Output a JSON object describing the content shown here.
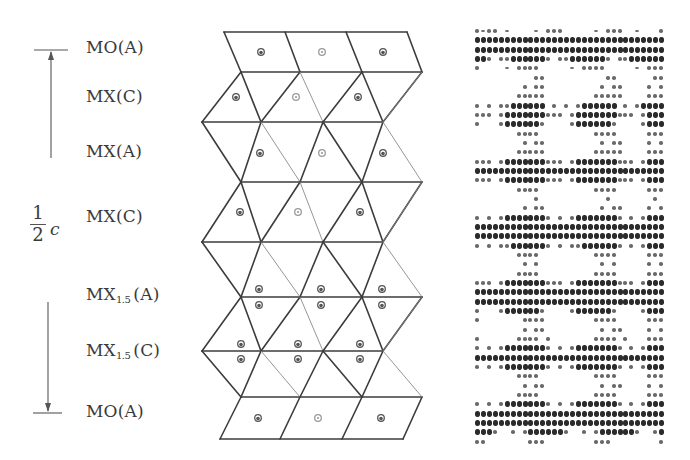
{
  "figure": {
    "left_scale": {
      "fraction_numerator": "1",
      "fraction_denominator": "2",
      "variable": "c",
      "arrow_top_y": 50,
      "arrow_bottom_y": 413
    },
    "layers": [
      {
        "id": "mo-a-top",
        "formula": "MO",
        "sub": "",
        "stacking": "(A)",
        "y": 49
      },
      {
        "id": "mx-c-1",
        "formula": "MX",
        "sub": "",
        "stacking": "(C)",
        "y": 98
      },
      {
        "id": "mx-a",
        "formula": "MX",
        "sub": "",
        "stacking": "(A)",
        "y": 153
      },
      {
        "id": "mx-c-2",
        "formula": "MX",
        "sub": "",
        "stacking": "(C)",
        "y": 218
      },
      {
        "id": "mx15-a",
        "formula": "MX",
        "sub": "1.5",
        "stacking": "(A)",
        "y": 296
      },
      {
        "id": "mx15-c",
        "formula": "MX",
        "sub": "1.5",
        "stacking": "(C)",
        "y": 352
      },
      {
        "id": "mo-a-bottom",
        "formula": "MO",
        "sub": "",
        "stacking": "(A)",
        "y": 413
      }
    ],
    "colors": {
      "line": "#3c3c3c",
      "thin_line": "#8a8a8a",
      "atom_dark": "#555555",
      "atom_light": "#9a9a9a",
      "text": "#3a3a3a"
    }
  },
  "structure": {
    "rows_y": [
      32,
      72,
      122,
      182,
      242,
      297,
      351,
      397,
      439
    ],
    "vertex_sets": {
      "top": [
        224,
        285,
        346,
        407
      ],
      "L": [
        241,
        300,
        362,
        422
      ],
      "R": [
        202,
        261,
        323,
        383
      ],
      "bottom": [
        220,
        280,
        342,
        403
      ]
    }
  },
  "hrtem": {
    "description": "simulated high-resolution image panel",
    "rows": [
      "d-dd.-....-.ddd.....-.ddd..-...d",
      "DDDDDDDDDDDDDDDDDDDDDDDDDDDDDDDD",
      "DDDDDDDDDDDDDDDDDDDDDDDDDDDDDDDD",
      "DDd.ddDDDDDDd.ddDDDDDDd.ddDDDDDD",
      "d....-.dddd.....-.dddd.....-.ddd",
      "..........dd..........dd......dd",
      "........d.dd.........d.dd....d.d",
      ".......ddddd........ddddd....ddd",
      "d.d.ddDDDDDD.d.d.dDDDDDD.d.dDDDD",
      "ddd.dDDDDDDDddd.dDDDDDDDddd.dDDD",
      "d...dDDDDDDd....dDDDDDDd....dDDD",
      ".......dddd.........dddd.....ddd",
      "........d.dd.........d.dd....d.d",
      ".......ddddd........ddddd....ddd",
      "ddd.dDDDDDDDddd.dDDDDDDDddd.dDDD",
      "DDDDDDDDDDDDDDDDDDDDDDDDDDDDDDDD",
      "ddd.dDDDDDDDddd.dDDDDDDDddd.dDDD",
      ".......dddd.........dddd.....ddd",
      "..........d...........d.......d.",
      "........d.dd.........d.dd....d.d",
      "d.d.dDDDDDDDd.d.dDDDDDDDd.d.dDDD",
      "DDDDDDDDDDDDDDDDDDDDDDDDDDDDDDDD",
      "DDDDDDDDDDDDDDDDDDDDDDDDDDDDDDDD",
      "d.d.ddDDDDDDd.d.ddDDDDDDd.d.dDDD",
      ".......dddd.........dddd.....ddd",
      "........d.d..........d.d.....d.d",
      ".......dddd.........dddd.....ddd",
      "ddd.dDDDDDDDddd.dDDDDDDDddd.dDDD",
      "DDDDDDDDDDDDDDDDDDDDDDDDDDDDDDDD",
      "DDDDDDDDDDDDDDDDDDDDDDDDDDDDDDDD",
      "d...dDDDDDDd....dDDDDDDd....dDDD",
      "d.......dddd........dddd.....ddd",
      "........d.dd.........d.dd....d.d",
      "d......dddd.d.......dddd.d...ddd",
      "d.d.dDDDDDDDd.d.dDDDDDDDd.d.dDDD",
      "DDDDDDDDDDDDDDDDDDDDDDDDDDDDDDDD",
      "d.d.dDDDDDDDd.d.dDDDDDDDd.d.dDDD",
      ".......dddd.........dddd.....ddd",
      "........d.dd.........d.dd....d.d",
      ".......dddd.........dddd.....ddd",
      "d.d.dDDDDDDDd.d.dDDDDDDDd.d.dDDD",
      "DDDDDDDDDDDDDDDDDDDDDDDDDDDDDDDD",
      "DDDDDDDDDDDDDDDDDDDDDDDDDDDDDDDD",
      "DDDd..d.dDDDDDDd..d.dDDDDDDd..dD",
      "dd.......ddd........ddd........d"
    ]
  }
}
